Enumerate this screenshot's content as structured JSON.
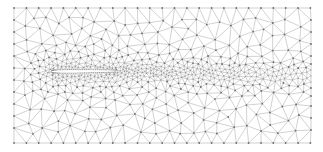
{
  "figure": {
    "description": "Unstructured triangular mesh around an airfoil with refined wake region",
    "width": 323,
    "height": 152
  },
  "mesh": {
    "domain": {
      "x0": 14,
      "y0": 8,
      "x1": 311,
      "y1": 143
    },
    "edge_color": "#9a9a9a",
    "node_color": "#6f6f6f",
    "background": "#ffffff",
    "coarse_spacing": 13,
    "fine_spacing": 2.2,
    "seed": 7
  },
  "airfoil": {
    "leading_edge": {
      "x": 52,
      "y": 71.5
    },
    "trailing_edge": {
      "x": 117,
      "y": 71
    },
    "max_thickness": 8.5,
    "fill": "#ffffff",
    "outline": "#ffffff"
  },
  "wake": {
    "start_x": 117,
    "end_x": 311,
    "center_y_start": 71,
    "center_y_end": 76,
    "half_width_start": 6,
    "half_width_end": 16
  }
}
